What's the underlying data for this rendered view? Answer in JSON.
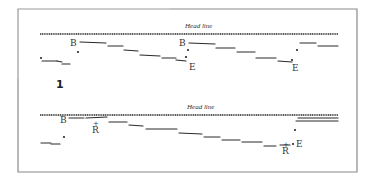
{
  "figure": {
    "frame": {
      "x": 18,
      "y": 9,
      "width": 152,
      "height": 70,
      "color": "#8a8a8a"
    },
    "ink_color": "#2a2a2a",
    "figure_number": "1",
    "panels": [
      {
        "name": "top",
        "headline": {
          "label": "Head line",
          "x1": 40,
          "x2": 338,
          "y": 34,
          "label_x": 185,
          "label_y": 28
        },
        "segments": [
          [
            42,
            61,
            57,
            61
          ],
          [
            57,
            61,
            62,
            62
          ],
          [
            62,
            64,
            70,
            64
          ],
          [
            80,
            42,
            106,
            43
          ],
          [
            108,
            46,
            123,
            46
          ],
          [
            124,
            50,
            138,
            51
          ],
          [
            140,
            55,
            160,
            56
          ],
          [
            162,
            58,
            176,
            58
          ],
          [
            176,
            60,
            186,
            61
          ],
          [
            189,
            43,
            215,
            44
          ],
          [
            216,
            48,
            235,
            48
          ],
          [
            237,
            52,
            255,
            52
          ],
          [
            256,
            58,
            276,
            58
          ],
          [
            278,
            61,
            292,
            62
          ],
          [
            300,
            43,
            316,
            43
          ],
          [
            318,
            46,
            338,
            46
          ]
        ],
        "dots": [
          [
            41,
            58
          ],
          [
            78,
            52
          ],
          [
            186,
            57
          ],
          [
            188,
            50
          ],
          [
            292,
            60
          ],
          [
            297,
            50
          ]
        ],
        "labels": [
          {
            "text": "B",
            "x": 70,
            "y": 46,
            "size": 9
          },
          {
            "text": "B",
            "x": 179,
            "y": 46,
            "size": 9
          },
          {
            "text": "E",
            "x": 189,
            "y": 70,
            "size": 9
          },
          {
            "text": "E",
            "x": 292,
            "y": 71,
            "size": 9
          }
        ]
      },
      {
        "name": "bottom",
        "headline": {
          "label": "Head line",
          "x1": 40,
          "x2": 338,
          "y": 115,
          "label_x": 187,
          "label_y": 109
        },
        "segments": [
          [
            69,
            118,
            84,
            118
          ],
          [
            86,
            118,
            107,
            117
          ],
          [
            109,
            122,
            127,
            122
          ],
          [
            129,
            125,
            143,
            126
          ],
          [
            146,
            129,
            177,
            129
          ],
          [
            179,
            133,
            202,
            134
          ],
          [
            204,
            137,
            220,
            137
          ],
          [
            222,
            140,
            240,
            140
          ],
          [
            242,
            142,
            262,
            142
          ],
          [
            264,
            146,
            276,
            146
          ],
          [
            280,
            145,
            290,
            145
          ],
          [
            298,
            118,
            338,
            118
          ],
          [
            296,
            121,
            338,
            121
          ],
          [
            41,
            143,
            51,
            143
          ],
          [
            51,
            144,
            60,
            144
          ]
        ],
        "dots": [
          [
            64,
            137
          ],
          [
            295,
            130
          ],
          [
            293,
            144
          ]
        ],
        "labels": [
          {
            "text": "B",
            "x": 60,
            "y": 123,
            "size": 9
          },
          {
            "text": "R",
            "x": 92,
            "y": 133,
            "size": 9
          },
          {
            "text": "+",
            "x": 93,
            "y": 126,
            "size": 7
          },
          {
            "text": "E",
            "x": 296,
            "y": 147,
            "size": 9
          },
          {
            "text": "R",
            "x": 282,
            "y": 154,
            "size": 9
          },
          {
            "text": "+",
            "x": 283,
            "y": 147,
            "size": 7
          }
        ]
      }
    ]
  }
}
